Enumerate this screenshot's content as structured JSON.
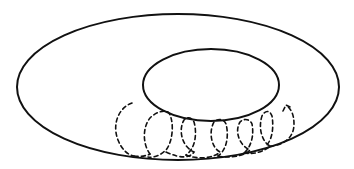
{
  "diagram": {
    "title": "",
    "elements": [
      {
        "id": "outer-ellipse",
        "kind": "ellipse",
        "style": "solid"
      },
      {
        "id": "inner-ellipse",
        "kind": "ellipse",
        "style": "solid"
      },
      {
        "id": "helical-path",
        "kind": "helix",
        "style": "dashed",
        "turns": 6,
        "direction": "left-to-right",
        "arrowhead": "end"
      }
    ],
    "colors": {
      "stroke": "#111111",
      "background": "#ffffff"
    },
    "labels": []
  }
}
